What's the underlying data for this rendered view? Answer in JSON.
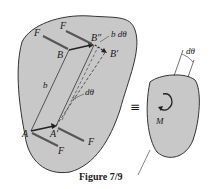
{
  "figure": {
    "caption": "Figure 7/9",
    "equivalence_symbol": "≡",
    "left_body": {
      "labels": {
        "F_top": "F",
        "F_left": "F",
        "B": "B",
        "B_double_prime": "B″",
        "B_prime": "B′",
        "b_dtheta": "b dθ",
        "b": "b",
        "dtheta": "dθ",
        "A": "A",
        "A_prime": "A′",
        "F_bottom_left": "F",
        "F_bottom_right": "F"
      }
    },
    "right_body": {
      "labels": {
        "dtheta": "dθ",
        "M": "M"
      }
    },
    "colors": {
      "body_fill": "#c8c8c8",
      "outline": "#333333",
      "force_arrow": "#555555",
      "text": "#1a1a1a"
    }
  }
}
